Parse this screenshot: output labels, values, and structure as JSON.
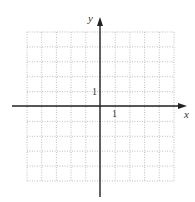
{
  "diagram": {
    "type": "coordinate-grid",
    "axes": {
      "x_label": "x",
      "y_label": "y",
      "x_tick_label": "1",
      "y_tick_label": "1"
    },
    "grid": {
      "columns": 10,
      "rows": 10,
      "x_range": [
        -5,
        5
      ],
      "y_range": [
        -5,
        5
      ],
      "line_style": "dotted"
    },
    "colors": {
      "axis": "#222222",
      "grid": "#b8b8b8",
      "background": "#ffffff"
    }
  }
}
